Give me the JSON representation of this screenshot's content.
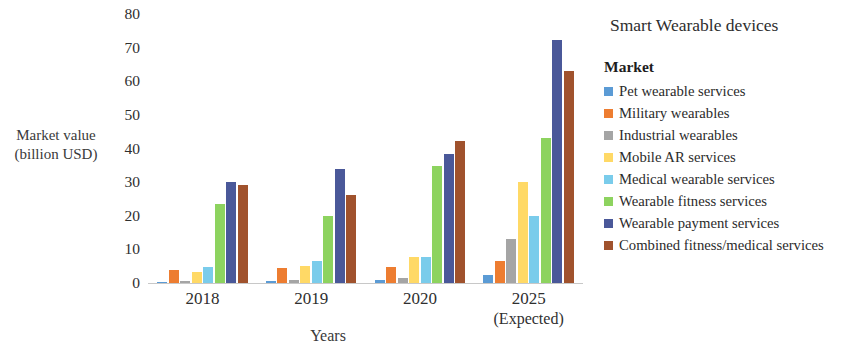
{
  "chart": {
    "title": "Smart Wearable devices",
    "legend_title": "Market",
    "y_axis_title_line1": "Market value",
    "y_axis_title_line2": "(billion USD)",
    "x_axis_title": "Years"
  },
  "chart_data": {
    "type": "bar",
    "title": "Smart Wearable devices",
    "xlabel": "Years",
    "ylabel": "Market value (billion USD)",
    "ylim": [
      0,
      80
    ],
    "yticks": [
      0,
      10,
      20,
      30,
      40,
      50,
      60,
      70,
      80
    ],
    "ytick_labels": [
      "0",
      "10",
      "20",
      "30",
      "40",
      "50",
      "60",
      "70",
      "80"
    ],
    "grid": false,
    "legend_position": "right",
    "legend_title": "Market",
    "categories": [
      "2018",
      "2019",
      "2020",
      "2025"
    ],
    "category_sublabels": [
      "",
      "",
      "",
      "(Expected)"
    ],
    "series": [
      {
        "name": "Pet wearable services",
        "color": "#5B9BD5",
        "values": [
          0.4,
          0.6,
          0.9,
          2.4
        ]
      },
      {
        "name": "Military wearables",
        "color": "#ED7D31",
        "values": [
          4.0,
          4.4,
          4.8,
          6.6
        ]
      },
      {
        "name": "Industrial wearables",
        "color": "#A5A5A5",
        "values": [
          0.5,
          0.9,
          1.6,
          13.2
        ]
      },
      {
        "name": "Mobile AR services",
        "color": "#FFD966",
        "values": [
          3.3,
          5.0,
          7.6,
          30.0
        ]
      },
      {
        "name": "Medical wearable services",
        "color": "#7ACCEB",
        "values": [
          4.8,
          6.4,
          7.7,
          20.0
        ]
      },
      {
        "name": "Wearable fitness services",
        "color": "#8DD35F",
        "values": [
          23.5,
          20.0,
          34.7,
          43.2
        ]
      },
      {
        "name": "Wearable payment services",
        "color": "#4A5899",
        "values": [
          30.0,
          33.8,
          38.5,
          72.4
        ]
      },
      {
        "name": "Combined fitness/medical services",
        "color": "#A0522D",
        "values": [
          29.2,
          26.2,
          42.2,
          63.0
        ]
      }
    ]
  }
}
